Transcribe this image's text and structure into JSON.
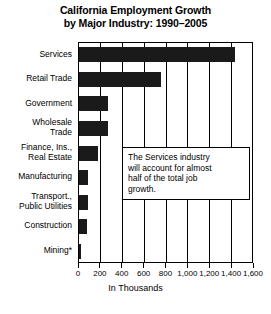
{
  "chart_data": {
    "type": "bar",
    "orientation": "horizontal",
    "title": "California Employment Growth by Major Industry: 1990–2005",
    "title_lines": [
      "California Employment Growth",
      "by Major Industry: 1990–2005"
    ],
    "xlabel": "In Thousands",
    "ylabel": "",
    "categories": [
      "Services",
      "Retail Trade",
      "Government",
      "Wholesale Trade",
      "Finance, Ins., Real Estate",
      "Manufacturing",
      "Transport., Public Utilities",
      "Construction",
      "Mining*"
    ],
    "category_label_lines": [
      [
        "Services"
      ],
      [
        "Retail Trade"
      ],
      [
        "Government"
      ],
      [
        "Wholesale",
        "Trade"
      ],
      [
        "Finance, Ins.,",
        "Real Estate"
      ],
      [
        "Manufacturing"
      ],
      [
        "Transport.,",
        "Public Utilities"
      ],
      [
        "Construction"
      ],
      [
        "Mining*"
      ]
    ],
    "values": [
      1430,
      750,
      265,
      265,
      175,
      80,
      80,
      75,
      5
    ],
    "xlim": [
      0,
      1600
    ],
    "xticks": [
      0,
      200,
      400,
      600,
      800,
      1000,
      1200,
      1400,
      1600
    ],
    "xtick_labels": [
      "0",
      "200",
      "400",
      "600",
      "800",
      "1,000",
      "1,200",
      "1,400",
      "1,600"
    ],
    "grid": true,
    "grid_axis": "x",
    "legend": false,
    "bar_color": "#1a1a1a",
    "annotations": [
      {
        "text": "The Services industry will account for almost half of the total job growth.",
        "lines": [
          "The Services industry",
          "will account for almost",
          "half of the total job",
          "growth."
        ]
      }
    ]
  },
  "colors": {
    "bar": "#1a1a1a",
    "axis": "#000000",
    "background": "#ffffff",
    "callout_background": "#ffffff",
    "callout_border": "#000000"
  }
}
